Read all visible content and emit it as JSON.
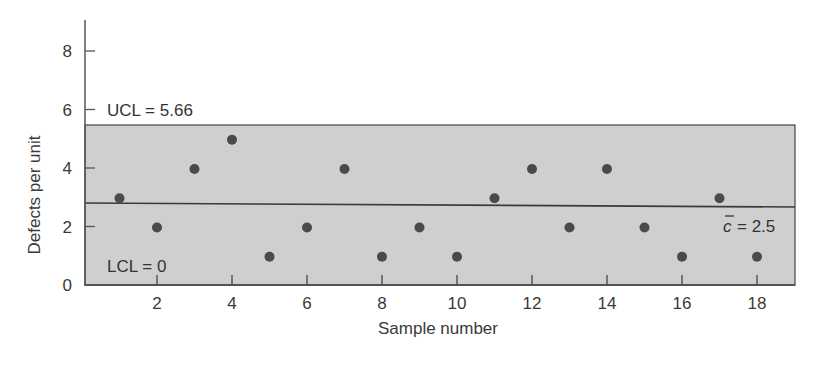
{
  "chart_data": {
    "type": "scatter",
    "title": "",
    "xlabel": "Sample number",
    "ylabel": "Defects per unit",
    "x": [
      1,
      2,
      3,
      4,
      5,
      6,
      7,
      8,
      9,
      10,
      11,
      12,
      13,
      14,
      15,
      16,
      17,
      18
    ],
    "values": [
      3,
      2,
      4,
      5,
      1,
      2,
      4,
      1,
      2,
      1,
      3,
      4,
      2,
      4,
      2,
      1,
      3,
      1
    ],
    "xticks": [
      2,
      4,
      6,
      8,
      10,
      12,
      14,
      16,
      18
    ],
    "yticks": [
      0,
      2,
      4,
      6,
      8
    ],
    "xlim": [
      0,
      19
    ],
    "ylim": [
      0,
      9
    ],
    "grid": false,
    "legend": null,
    "control_limits": {
      "ucl": 5.66,
      "center": 2.5,
      "lcl": 0
    },
    "annotations": {
      "ucl_label": "UCL = 5.66",
      "lcl_label": "LCL = 0",
      "center_symbol": "c",
      "center_label": "= 2.5"
    },
    "colors": {
      "band": "#cfcfcf",
      "point": "#4a4a4a",
      "line": "#3a3a3a",
      "axis": "#555555"
    }
  }
}
